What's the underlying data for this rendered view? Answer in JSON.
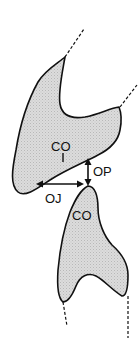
{
  "diagram": {
    "type": "dental-occlusion-schematic",
    "colors": {
      "fill": "#d9d9d9",
      "stroke": "#111111",
      "background": "#ffffff"
    },
    "labels": {
      "upper_tooth_cusp": "CO",
      "lower_tooth_cusp": "CO",
      "vertical_gap": "OP",
      "horizontal_gap": "OJ"
    }
  }
}
